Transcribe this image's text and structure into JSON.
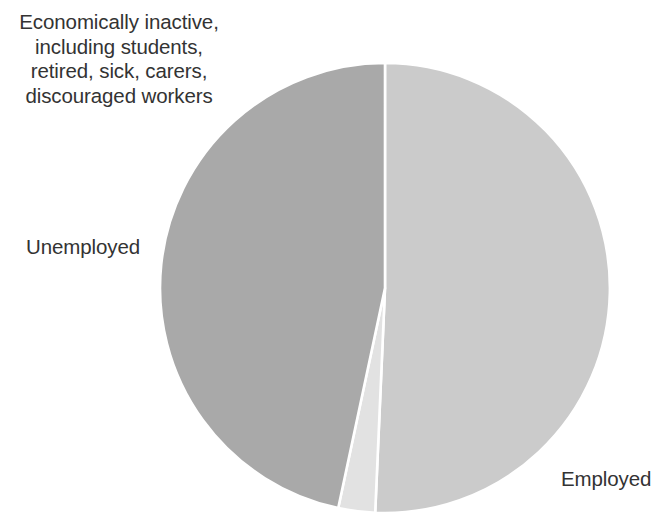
{
  "chart_data": {
    "type": "pie",
    "title": "",
    "subtitle": "",
    "xlabel": "",
    "ylabel": "",
    "grid": false,
    "legend_position": "none",
    "center": {
      "x": 385,
      "y": 288
    },
    "radius": 225,
    "start_angle_deg": 0,
    "direction": "clockwise",
    "separator_color": "#ffffff",
    "background_color": "#ffffff",
    "labels": [
      "Employed",
      "Unemployed",
      "Economically inactive, including students, retired, sick, carers, discouraged workers"
    ],
    "values": [
      50.7,
      2.6,
      46.7
    ],
    "units": "percent",
    "slices": [
      {
        "name": "employed",
        "label": "Employed",
        "value": 50.7,
        "color": "#cbcbcb",
        "start_deg": 0,
        "end_deg": 182.5
      },
      {
        "name": "unemployed",
        "label": "Unemployed",
        "value": 2.6,
        "color": "#e2e2e2",
        "start_deg": 182.5,
        "end_deg": 192.0
      },
      {
        "name": "economically-inactive",
        "label": "Economically inactive, including students, retired, sick, carers, discouraged workers",
        "value": 46.7,
        "color": "#a9a9a9",
        "start_deg": 192.0,
        "end_deg": 360
      }
    ]
  },
  "labels": {
    "inactive": "Economically inactive, including students, retired, sick, carers, discouraged workers",
    "unemployed": "Unemployed",
    "employed": "Employed"
  }
}
